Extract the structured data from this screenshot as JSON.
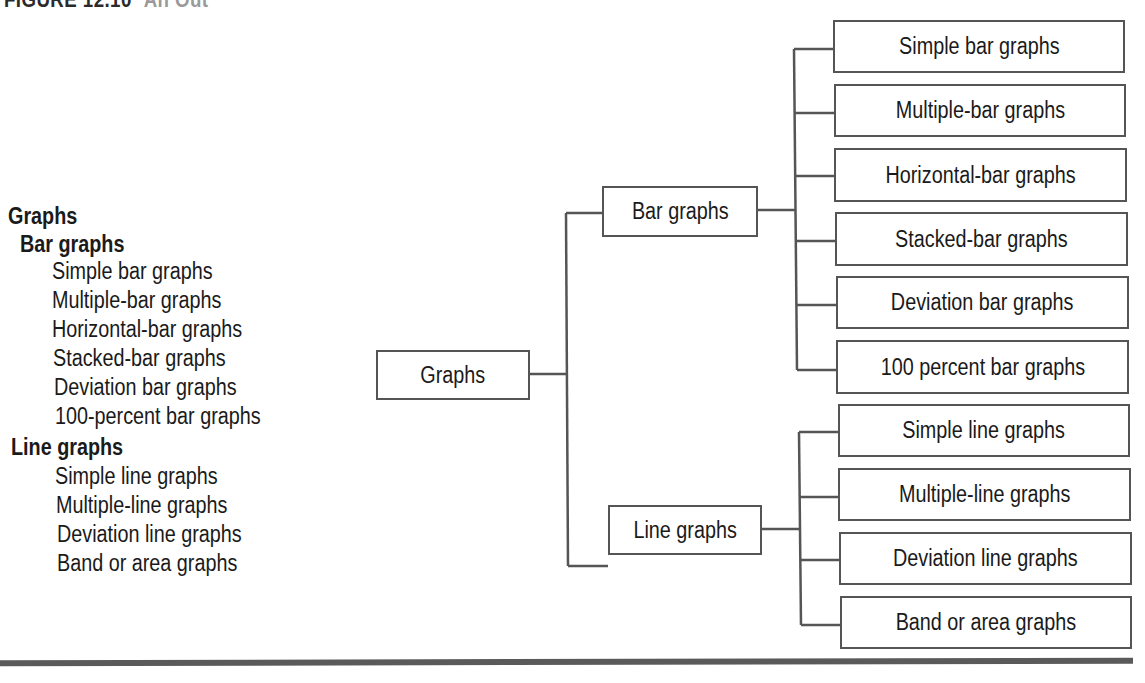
{
  "figure": {
    "label": "FIGURE 12.10",
    "label_suffix": "An Out"
  },
  "outline": {
    "items": [
      {
        "text": "Graphs",
        "level": 0,
        "bold": true
      },
      {
        "text": "Bar graphs",
        "level": 1,
        "bold": true
      },
      {
        "text": "Simple bar graphs",
        "level": 2,
        "bold": false
      },
      {
        "text": "Multiple-bar graphs",
        "level": 2,
        "bold": false
      },
      {
        "text": "Horizontal-bar graphs",
        "level": 2,
        "bold": false
      },
      {
        "text": "Stacked-bar graphs",
        "level": 2,
        "bold": false
      },
      {
        "text": "Deviation bar graphs",
        "level": 2,
        "bold": false
      },
      {
        "text": "100-percent bar graphs",
        "level": 2,
        "bold": false
      },
      {
        "text": "Line graphs",
        "level": 1,
        "bold": true
      },
      {
        "text": "Simple line graphs",
        "level": 2,
        "bold": false
      },
      {
        "text": "Multiple-line graphs",
        "level": 2,
        "bold": false
      },
      {
        "text": "Deviation line graphs",
        "level": 2,
        "bold": false
      },
      {
        "text": "Band or area graphs",
        "level": 2,
        "bold": false
      }
    ]
  },
  "tree": {
    "root": {
      "label": "Graphs"
    },
    "bar": {
      "label": "Bar graphs",
      "children": [
        "Simple bar graphs",
        "Multiple-bar graphs",
        "Horizontal-bar graphs",
        "Stacked-bar graphs",
        "Deviation bar graphs",
        "100 percent bar graphs"
      ]
    },
    "line": {
      "label": "Line graphs",
      "children": [
        "Simple line graphs",
        "Multiple-line graphs",
        "Deviation line graphs",
        "Band or area graphs"
      ]
    }
  },
  "colors": {
    "line": "#555555",
    "text": "#1a1a1a",
    "rule": "#5a5a5a"
  }
}
